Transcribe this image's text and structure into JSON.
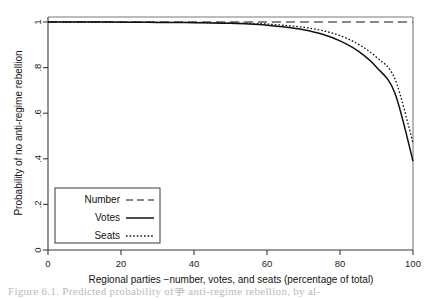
{
  "chart_data": {
    "type": "line",
    "title": "",
    "xlabel": "Regional parties −number, votes, and seats (percentage of total)",
    "ylabel": "Probability of no anti-regime rebellion",
    "xlim": [
      0,
      100
    ],
    "ylim": [
      0,
      1
    ],
    "grid": false,
    "legend_position": "lower-left-inside",
    "xticks": [
      "0",
      "20",
      "40",
      "60",
      "80",
      "100"
    ],
    "xtick_values": [
      0,
      20,
      40,
      60,
      80,
      100
    ],
    "yticks": [
      "0",
      ".2",
      ".4",
      ".6",
      ".8",
      "1"
    ],
    "ytick_values": [
      0,
      0.2,
      0.4,
      0.6,
      0.8,
      1
    ],
    "x": [
      0,
      5,
      10,
      15,
      20,
      25,
      30,
      35,
      40,
      45,
      50,
      55,
      60,
      65,
      70,
      75,
      80,
      85,
      90,
      95,
      100
    ],
    "series": [
      {
        "name": "Number",
        "style": "dashed",
        "values": [
          1.0,
          1.0,
          1.0,
          1.0,
          1.0,
          1.0,
          1.0,
          1.0,
          1.0,
          1.0,
          1.0,
          1.0,
          1.0,
          1.0,
          1.0,
          1.0,
          1.0,
          1.0,
          1.0,
          1.0,
          1.0
        ]
      },
      {
        "name": "Votes",
        "style": "solid",
        "values": [
          1.0,
          1.0,
          1.0,
          1.0,
          0.999,
          0.999,
          0.998,
          0.998,
          0.997,
          0.996,
          0.994,
          0.991,
          0.986,
          0.978,
          0.966,
          0.947,
          0.917,
          0.872,
          0.802,
          0.69,
          0.39
        ]
      },
      {
        "name": "Seats",
        "style": "dotted",
        "values": [
          1.0,
          1.0,
          1.0,
          1.0,
          0.999,
          0.999,
          0.999,
          0.998,
          0.998,
          0.997,
          0.996,
          0.994,
          0.991,
          0.985,
          0.977,
          0.963,
          0.94,
          0.903,
          0.845,
          0.752,
          0.47
        ]
      }
    ]
  },
  "legend": {
    "entries": [
      {
        "label": "Number",
        "style": "dashed"
      },
      {
        "label": "Votes",
        "style": "solid"
      },
      {
        "label": "Seats",
        "style": "dotted"
      }
    ]
  },
  "caption": {
    "text": "Figure 6.1.  Predicted probability of争 anti-regime rebellion, by al-"
  }
}
